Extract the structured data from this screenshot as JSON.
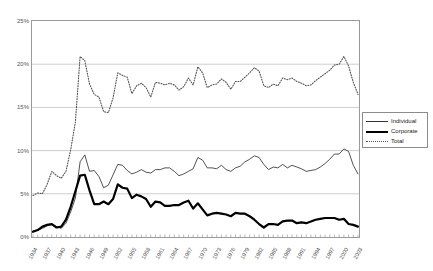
{
  "chart_data": {
    "type": "line",
    "title": "",
    "xlabel": "",
    "ylabel": "",
    "ylim": [
      0,
      25
    ],
    "ytick_labels": [
      "0%",
      "5%",
      "10%",
      "15%",
      "20%",
      "25%"
    ],
    "ytick_values": [
      0,
      5,
      10,
      15,
      20,
      25
    ],
    "grid": "horizontal",
    "legend_position": "right",
    "x_start": 1934,
    "x_end": 2003,
    "xtick_labels": [
      "1934",
      "1937",
      "1940",
      "1943",
      "1946",
      "1949",
      "1952",
      "1955",
      "1958",
      "1961",
      "1964",
      "1967",
      "1970",
      "1973",
      "1976",
      "1979",
      "1982",
      "1985",
      "1988",
      "1991",
      "1994",
      "1997",
      "2000",
      "2003"
    ],
    "x": [
      1934,
      1935,
      1936,
      1937,
      1938,
      1939,
      1940,
      1941,
      1942,
      1943,
      1944,
      1945,
      1946,
      1947,
      1948,
      1949,
      1950,
      1951,
      1952,
      1953,
      1954,
      1955,
      1956,
      1957,
      1958,
      1959,
      1960,
      1961,
      1962,
      1963,
      1964,
      1965,
      1966,
      1967,
      1968,
      1969,
      1970,
      1971,
      1972,
      1973,
      1974,
      1975,
      1976,
      1977,
      1978,
      1979,
      1980,
      1981,
      1982,
      1983,
      1984,
      1985,
      1986,
      1987,
      1988,
      1989,
      1990,
      1991,
      1992,
      1993,
      1994,
      1995,
      1996,
      1997,
      1998,
      1999,
      2000,
      2001,
      2002,
      2003
    ],
    "series": [
      {
        "name": "Individual",
        "style": "thin-solid",
        "color": "#333333",
        "values": [
          0.7,
          0.8,
          1.0,
          1.3,
          1.4,
          1.2,
          1.0,
          1.6,
          2.9,
          4.5,
          8.7,
          9.5,
          7.6,
          7.7,
          7.0,
          5.7,
          6.0,
          7.2,
          8.4,
          8.3,
          7.7,
          7.3,
          7.5,
          7.8,
          7.5,
          7.4,
          7.8,
          7.8,
          8.0,
          8.0,
          7.6,
          7.1,
          7.3,
          7.6,
          7.9,
          9.2,
          8.9,
          8.0,
          8.0,
          7.9,
          8.3,
          7.8,
          7.6,
          8.0,
          8.2,
          8.7,
          9.0,
          9.4,
          9.2,
          8.4,
          7.8,
          8.1,
          8.0,
          8.4,
          8.0,
          8.3,
          8.1,
          7.9,
          7.6,
          7.7,
          7.8,
          8.1,
          8.5,
          9.0,
          9.6,
          9.6,
          10.2,
          9.9,
          8.3,
          7.3
        ]
      },
      {
        "name": "Corporate",
        "style": "thick-solid",
        "color": "#000000",
        "values": [
          0.6,
          0.8,
          1.2,
          1.4,
          1.5,
          1.1,
          1.2,
          2.0,
          3.5,
          5.3,
          7.1,
          7.2,
          5.4,
          3.8,
          3.8,
          4.1,
          3.8,
          4.4,
          6.1,
          5.7,
          5.6,
          4.5,
          4.9,
          4.7,
          4.4,
          3.5,
          4.1,
          4.0,
          3.6,
          3.6,
          3.7,
          3.7,
          4.0,
          4.2,
          3.3,
          3.9,
          3.2,
          2.5,
          2.7,
          2.8,
          2.7,
          2.6,
          2.4,
          2.8,
          2.7,
          2.7,
          2.4,
          2.0,
          1.5,
          1.1,
          1.5,
          1.5,
          1.4,
          1.8,
          1.9,
          1.9,
          1.6,
          1.7,
          1.6,
          1.8,
          2.0,
          2.1,
          2.2,
          2.2,
          2.2,
          2.0,
          2.1,
          1.5,
          1.4,
          1.2
        ]
      },
      {
        "name": "Total",
        "style": "dotted",
        "color": "#555555",
        "values": [
          4.8,
          5.1,
          5.0,
          6.1,
          7.6,
          7.1,
          6.8,
          7.6,
          10.1,
          13.3,
          20.9,
          20.4,
          17.7,
          16.5,
          16.2,
          14.5,
          14.4,
          16.1,
          19.0,
          18.7,
          18.5,
          16.6,
          17.5,
          17.8,
          17.3,
          16.2,
          17.9,
          17.8,
          17.6,
          17.8,
          17.6,
          17.0,
          17.4,
          18.4,
          17.6,
          19.7,
          19.0,
          17.3,
          17.6,
          17.7,
          18.3,
          17.9,
          17.1,
          18.0,
          18.0,
          18.5,
          19.0,
          19.6,
          19.2,
          17.5,
          17.3,
          17.7,
          17.5,
          18.4,
          18.2,
          18.4,
          18.0,
          17.8,
          17.5,
          17.6,
          18.1,
          18.5,
          18.9,
          19.3,
          19.9,
          20.0,
          20.9,
          19.8,
          17.9,
          16.5
        ]
      }
    ]
  },
  "legend": {
    "items": [
      {
        "label": "Individual"
      },
      {
        "label": "Corporate"
      },
      {
        "label": "Total"
      }
    ]
  }
}
